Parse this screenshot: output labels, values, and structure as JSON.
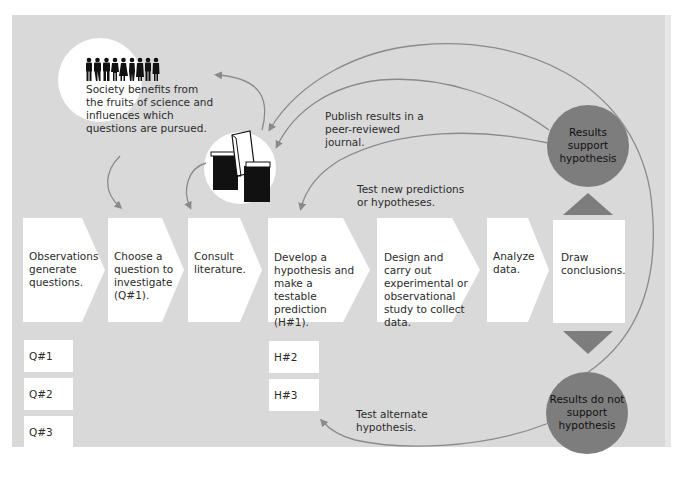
{
  "diagram": {
    "colors": {
      "panel": "#d9d9d9",
      "box": "#ffffff",
      "result_circle": "#7d7d7d",
      "triangle": "#7d7d7d",
      "arrow": "#8a8a8a",
      "text": "#2b2b2b"
    },
    "steps": [
      {
        "id": "observations",
        "label": "Observations generate questions."
      },
      {
        "id": "choose-question",
        "label": "Choose a question to investigate (Q#1)."
      },
      {
        "id": "consult-literature",
        "label": "Consult literature."
      },
      {
        "id": "develop-hypothesis",
        "label": "Develop a hypothesis and make a testable prediction (H#1)."
      },
      {
        "id": "design-study",
        "label": "Design and carry out experimental or observational study to collect data."
      },
      {
        "id": "analyze-data",
        "label": "Analyze data."
      },
      {
        "id": "draw-conclusions",
        "label": "Draw conclusions."
      }
    ],
    "questions": [
      "Q#1",
      "Q#2",
      "Q#3"
    ],
    "hypotheses": [
      "H#2",
      "H#3"
    ],
    "society": {
      "icon": "people-silhouettes-icon",
      "label": "Society benefits from the fruits of science and influences which questions are pursued."
    },
    "literature": {
      "icon": "books-journals-icon"
    },
    "results_support": "Results support hypothesis",
    "results_not_support": "Results do not support hypothesis",
    "annotations": {
      "publish": "Publish results in a peer-reviewed journal.",
      "test_new": "Test new predictions or hypotheses.",
      "test_alternate": "Test alternate hypothesis."
    }
  }
}
